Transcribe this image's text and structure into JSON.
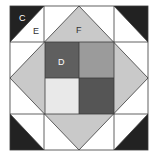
{
  "diagram": {
    "type": "quilt-block",
    "labels": {
      "c": "C",
      "d": "D",
      "e": "E",
      "f": "F"
    },
    "colors": {
      "background": "#ffffff",
      "outline": "#3a3a3a",
      "corner_dark": "#222222",
      "diamond": "#c9c9c9",
      "square_top_left": "#5f5f5f",
      "square_top_right": "#9b9b9b",
      "square_bottom_left": "#e9e9e9",
      "square_bottom_right": "#555555",
      "label_light": "#ffffff",
      "label_dark": "#333333"
    }
  }
}
